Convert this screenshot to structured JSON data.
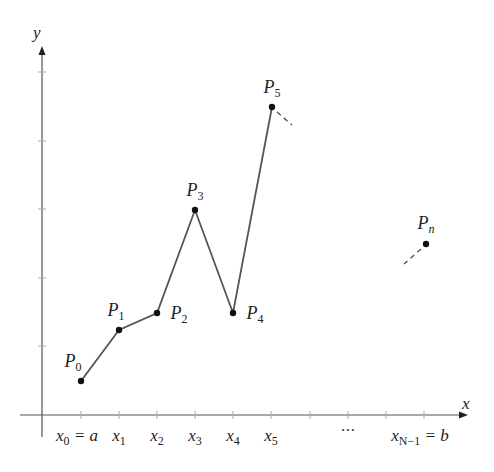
{
  "diagram": {
    "axes": {
      "x_label": "x",
      "y_label": "y",
      "origin_px": [
        42,
        415
      ],
      "x_end_px": 468,
      "y_end_px": 46
    },
    "x_ticks": [
      {
        "px": 81,
        "label": "x",
        "sub": "0",
        "suffix": " = a"
      },
      {
        "px": 119,
        "label": "x",
        "sub": "1",
        "suffix": ""
      },
      {
        "px": 157,
        "label": "x",
        "sub": "2",
        "suffix": ""
      },
      {
        "px": 195,
        "label": "x",
        "sub": "3",
        "suffix": ""
      },
      {
        "px": 233,
        "label": "x",
        "sub": "4",
        "suffix": ""
      },
      {
        "px": 271,
        "label": "x",
        "sub": "5",
        "suffix": ""
      },
      {
        "px": 310,
        "label": "",
        "sub": "",
        "suffix": ""
      },
      {
        "px": 348,
        "label": "",
        "sub": "",
        "suffix": ""
      },
      {
        "px": 386,
        "label": "",
        "sub": "",
        "suffix": ""
      },
      {
        "px": 424,
        "label": "x",
        "sub": "N−1",
        "suffix": " = b"
      }
    ],
    "ellipsis": "···",
    "y_ticks_px": [
      72,
      141,
      209,
      278,
      346
    ],
    "points": [
      {
        "label": "P",
        "sub": "0",
        "px": [
          81,
          381
        ]
      },
      {
        "label": "P",
        "sub": "1",
        "px": [
          119,
          330
        ]
      },
      {
        "label": "P",
        "sub": "2",
        "px": [
          157,
          313
        ]
      },
      {
        "label": "P",
        "sub": "3",
        "px": [
          195,
          210
        ]
      },
      {
        "label": "P",
        "sub": "4",
        "px": [
          233,
          313
        ]
      },
      {
        "label": "P",
        "sub": "5",
        "px": [
          272,
          107
        ]
      },
      {
        "label": "P",
        "sub": "n",
        "px": [
          426,
          244
        ]
      }
    ],
    "line_color": "#555555",
    "point_color": "#111111"
  }
}
